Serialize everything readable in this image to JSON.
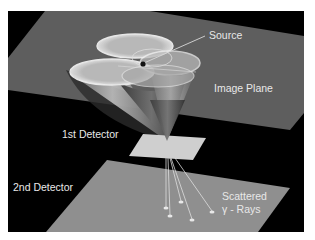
{
  "diagram": {
    "labels": {
      "source": "Source",
      "image_plane": "Image Plane",
      "first_detector": "1st Detector",
      "second_detector": "2nd Detector",
      "scattered_line1": "Scattered",
      "scattered_line2": "γ - Rays"
    },
    "colors": {
      "frame_background": "#000000",
      "image_plane": "#5e5e5e",
      "second_detector": "#8f8f8f",
      "first_detector": "#cfcfcf",
      "cones": "#d9d9d9",
      "label_text": "#e8e8e8"
    }
  }
}
